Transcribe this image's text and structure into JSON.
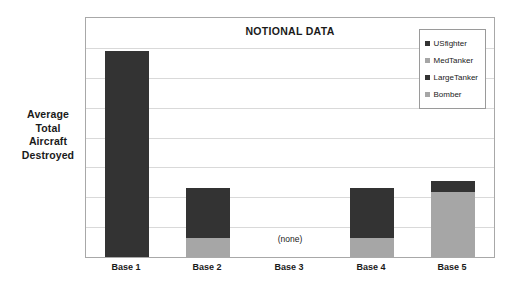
{
  "chart_data": {
    "type": "bar",
    "subtype": "stacked-bar",
    "title": "NOTIONAL DATA",
    "xlabel": "",
    "ylabel": "Average Total Aircraft Destroyed",
    "ylabel_lines": [
      "Average",
      "Total",
      "Aircraft",
      "Destroyed"
    ],
    "categories": [
      "Base 1",
      "Base 2",
      "Base 3",
      "Base 4",
      "Base 5"
    ],
    "series": [
      {
        "name": "USfighter",
        "color": "#333333",
        "values": [
          86,
          21,
          0,
          21,
          5
        ]
      },
      {
        "name": "MedTanker",
        "color": "#a6a6a6",
        "values": [
          0,
          0,
          0,
          0,
          0
        ]
      },
      {
        "name": "LargeTanker",
        "color": "#333333",
        "values": [
          0,
          0,
          0,
          0,
          0
        ]
      },
      {
        "name": "Bomber",
        "color": "#a6a6a6",
        "values": [
          0,
          8,
          0,
          8,
          27
        ]
      }
    ],
    "stack_order_bottom_to_top": [
      "Bomber",
      "USfighter"
    ],
    "ylim": [
      0,
      100
    ],
    "yticks_count": 8,
    "ytick_labels": [],
    "grid": true,
    "legend_position": "top-right",
    "annotations": [
      {
        "text": "(none)",
        "category": "Base 3",
        "reason": "no data for this category"
      }
    ]
  },
  "legend": {
    "items": [
      {
        "label": "USfighter",
        "color": "#333333"
      },
      {
        "label": "MedTanker",
        "color": "#a6a6a6"
      },
      {
        "label": "LargeTanker",
        "color": "#333333"
      },
      {
        "label": "Bomber",
        "color": "#a6a6a6"
      }
    ]
  },
  "colors": {
    "dark": "#333333",
    "gray": "#a6a6a6",
    "gridline": "#d9d9d9",
    "frame": "#a8a8a8",
    "background": "#ffffff",
    "text": "#1a1a1a"
  }
}
